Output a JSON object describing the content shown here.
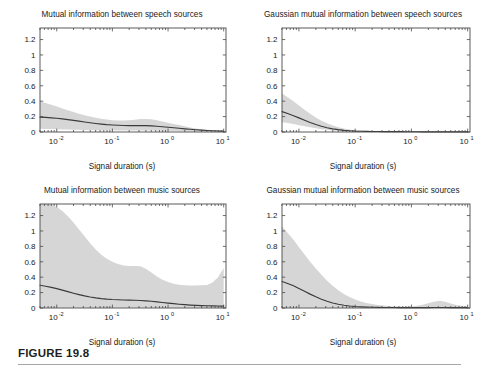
{
  "figure": {
    "caption_label": "FIGURE 19.8",
    "colors": {
      "band": "#d6d6d6",
      "line": "#3a3a3a",
      "axis": "#4a4a4a",
      "text": "#1a1a1a",
      "rule": "#a6a6a6"
    }
  },
  "common": {
    "xlabel": "Signal duration (s)",
    "y_ticks": [
      "0",
      "0.2",
      "0.4",
      "0.6",
      "0.8",
      "1",
      "1.2"
    ],
    "y_tick_values": [
      0,
      0.2,
      0.4,
      0.6,
      0.8,
      1,
      1.2
    ],
    "x_ticks": [
      {
        "mantissa": "10",
        "exponent": "-2",
        "value": 0.01
      },
      {
        "mantissa": "10",
        "exponent": "-1",
        "value": 0.1
      },
      {
        "mantissa": "10",
        "exponent": "0",
        "value": 1
      },
      {
        "mantissa": "10",
        "exponent": "1",
        "value": 10
      }
    ]
  },
  "chart_data": [
    {
      "id": "speech-mi",
      "type": "line",
      "title": "Mutual information between speech sources",
      "xlabel": "Signal duration (s)",
      "ylabel": "",
      "xscale": "log",
      "xlim": [
        0.005,
        11
      ],
      "ylim": [
        0,
        1.35
      ],
      "grid": false,
      "legend": "none",
      "x": [
        0.005,
        0.0063,
        0.008,
        0.01,
        0.0126,
        0.0158,
        0.02,
        0.0251,
        0.0316,
        0.0398,
        0.0501,
        0.0631,
        0.0794,
        0.1,
        0.126,
        0.158,
        0.2,
        0.251,
        0.316,
        0.398,
        0.501,
        0.631,
        0.794,
        1.0,
        1.26,
        1.58,
        2.0,
        2.51,
        3.16,
        3.98,
        5.01,
        6.31,
        7.94,
        10.0
      ],
      "series": [
        {
          "name": "mean",
          "values": [
            0.193,
            0.189,
            0.184,
            0.178,
            0.17,
            0.161,
            0.151,
            0.141,
            0.13,
            0.12,
            0.111,
            0.103,
            0.096,
            0.091,
            0.087,
            0.084,
            0.083,
            0.083,
            0.083,
            0.082,
            0.079,
            0.074,
            0.068,
            0.062,
            0.055,
            0.048,
            0.041,
            0.035,
            0.029,
            0.024,
            0.02,
            0.016,
            0.013,
            0.011
          ]
        },
        {
          "name": "band_upper",
          "values": [
            0.4,
            0.378,
            0.354,
            0.33,
            0.305,
            0.281,
            0.258,
            0.237,
            0.218,
            0.201,
            0.186,
            0.173,
            0.162,
            0.154,
            0.149,
            0.148,
            0.152,
            0.16,
            0.168,
            0.17,
            0.164,
            0.152,
            0.137,
            0.121,
            0.105,
            0.09,
            0.074,
            0.06,
            0.047,
            0.037,
            0.029,
            0.023,
            0.018,
            0.015
          ]
        },
        {
          "name": "band_lower",
          "values": [
            0.041,
            0.04,
            0.038,
            0.036,
            0.034,
            0.032,
            0.03,
            0.028,
            0.026,
            0.025,
            0.024,
            0.023,
            0.022,
            0.022,
            0.021,
            0.021,
            0.021,
            0.021,
            0.021,
            0.02,
            0.019,
            0.018,
            0.016,
            0.015,
            0.013,
            0.011,
            0.01,
            0.008,
            0.007,
            0.006,
            0.005,
            0.005,
            0.004,
            0.004
          ]
        }
      ]
    },
    {
      "id": "speech-gaussian-mi",
      "type": "line",
      "title": "Gaussian mutual information between speech sources",
      "xlabel": "Signal duration (s)",
      "ylabel": "",
      "xscale": "log",
      "xlim": [
        0.005,
        11
      ],
      "ylim": [
        0,
        1.35
      ],
      "grid": false,
      "legend": "none",
      "x": [
        0.005,
        0.0063,
        0.008,
        0.01,
        0.0126,
        0.0158,
        0.02,
        0.0251,
        0.0316,
        0.0398,
        0.0501,
        0.0631,
        0.0794,
        0.1,
        0.126,
        0.158,
        0.2,
        0.251,
        0.316,
        0.398,
        0.501,
        0.631,
        0.794,
        1.0,
        1.26,
        1.58,
        2.0,
        2.51,
        3.16,
        3.98,
        5.01,
        6.31,
        7.94,
        10.0
      ],
      "series": [
        {
          "name": "mean",
          "values": [
            0.265,
            0.24,
            0.212,
            0.183,
            0.153,
            0.124,
            0.098,
            0.075,
            0.056,
            0.041,
            0.03,
            0.022,
            0.016,
            0.012,
            0.01,
            0.008,
            0.007,
            0.006,
            0.005,
            0.005,
            0.004,
            0.004,
            0.003,
            0.003,
            0.003,
            0.002,
            0.002,
            0.002,
            0.002,
            0.002,
            0.002,
            0.001,
            0.001,
            0.001
          ]
        },
        {
          "name": "band_upper",
          "values": [
            0.5,
            0.452,
            0.4,
            0.345,
            0.29,
            0.237,
            0.189,
            0.147,
            0.112,
            0.083,
            0.061,
            0.045,
            0.033,
            0.025,
            0.02,
            0.016,
            0.014,
            0.012,
            0.011,
            0.01,
            0.009,
            0.008,
            0.007,
            0.007,
            0.006,
            0.005,
            0.005,
            0.004,
            0.004,
            0.003,
            0.003,
            0.003,
            0.002,
            0.002
          ]
        },
        {
          "name": "band_lower",
          "values": [
            0.128,
            0.116,
            0.103,
            0.089,
            0.075,
            0.061,
            0.048,
            0.037,
            0.028,
            0.021,
            0.015,
            0.011,
            0.008,
            0.006,
            0.005,
            0.004,
            0.003,
            0.003,
            0.002,
            0.002,
            0.002,
            0.002,
            0.001,
            0.001,
            0.001,
            0.001,
            0.001,
            0.001,
            0.001,
            0.001,
            0.0,
            0.0,
            0.0,
            0.0
          ]
        }
      ]
    },
    {
      "id": "music-mi",
      "type": "line",
      "title": "Mutual information between music sources",
      "xlabel": "Signal duration (s)",
      "ylabel": "",
      "xscale": "log",
      "xlim": [
        0.005,
        11
      ],
      "ylim": [
        0,
        1.35
      ],
      "grid": false,
      "legend": "none",
      "x": [
        0.005,
        0.0063,
        0.008,
        0.01,
        0.0126,
        0.0158,
        0.02,
        0.0251,
        0.0316,
        0.0398,
        0.0501,
        0.0631,
        0.0794,
        0.1,
        0.126,
        0.158,
        0.2,
        0.251,
        0.316,
        0.398,
        0.501,
        0.631,
        0.794,
        1.0,
        1.26,
        1.58,
        2.0,
        2.51,
        3.16,
        3.98,
        5.01,
        6.31,
        7.94,
        10.0
      ],
      "series": [
        {
          "name": "mean",
          "values": [
            0.295,
            0.283,
            0.268,
            0.251,
            0.232,
            0.212,
            0.192,
            0.174,
            0.157,
            0.143,
            0.131,
            0.122,
            0.115,
            0.11,
            0.107,
            0.104,
            0.102,
            0.1,
            0.097,
            0.093,
            0.087,
            0.08,
            0.072,
            0.064,
            0.056,
            0.049,
            0.043,
            0.038,
            0.034,
            0.031,
            0.029,
            0.027,
            0.026,
            0.025
          ]
        },
        {
          "name": "band_upper",
          "values": [
            1.35,
            1.35,
            1.34,
            1.31,
            1.26,
            1.19,
            1.11,
            1.02,
            0.93,
            0.84,
            0.76,
            0.69,
            0.64,
            0.6,
            0.57,
            0.552,
            0.545,
            0.545,
            0.542,
            0.51,
            0.46,
            0.41,
            0.368,
            0.336,
            0.315,
            0.302,
            0.295,
            0.292,
            0.292,
            0.294,
            0.3,
            0.33,
            0.4,
            0.52
          ]
        },
        {
          "name": "band_lower",
          "values": [
            0.004,
            0.004,
            0.004,
            0.004,
            0.004,
            0.004,
            0.004,
            0.004,
            0.004,
            0.004,
            0.004,
            0.004,
            0.004,
            0.004,
            0.004,
            0.004,
            0.004,
            0.004,
            0.004,
            0.004,
            0.004,
            0.004,
            0.004,
            0.004,
            0.004,
            0.004,
            0.004,
            0.004,
            0.004,
            0.004,
            0.004,
            0.004,
            0.004,
            0.004
          ]
        }
      ]
    },
    {
      "id": "music-gaussian-mi",
      "type": "line",
      "title": "Gaussian mutual information between music sources",
      "xlabel": "Signal duration (s)",
      "ylabel": "",
      "xscale": "log",
      "xlim": [
        0.005,
        11
      ],
      "ylim": [
        0,
        1.35
      ],
      "grid": false,
      "legend": "none",
      "x": [
        0.005,
        0.0063,
        0.008,
        0.01,
        0.0126,
        0.0158,
        0.02,
        0.0251,
        0.0316,
        0.0398,
        0.0501,
        0.0631,
        0.0794,
        0.1,
        0.126,
        0.158,
        0.2,
        0.251,
        0.316,
        0.398,
        0.501,
        0.631,
        0.794,
        1.0,
        1.26,
        1.58,
        2.0,
        2.51,
        3.16,
        3.98,
        5.01,
        6.31,
        7.94,
        10.0
      ],
      "series": [
        {
          "name": "mean",
          "values": [
            0.345,
            0.318,
            0.288,
            0.253,
            0.217,
            0.18,
            0.145,
            0.114,
            0.087,
            0.065,
            0.048,
            0.035,
            0.026,
            0.019,
            0.015,
            0.012,
            0.01,
            0.008,
            0.007,
            0.006,
            0.006,
            0.005,
            0.005,
            0.005,
            0.005,
            0.005,
            0.005,
            0.006,
            0.007,
            0.006,
            0.005,
            0.005,
            0.005,
            0.005
          ]
        },
        {
          "name": "band_upper",
          "values": [
            1.06,
            0.975,
            0.885,
            0.79,
            0.695,
            0.6,
            0.512,
            0.43,
            0.355,
            0.29,
            0.232,
            0.183,
            0.142,
            0.11,
            0.085,
            0.066,
            0.051,
            0.04,
            0.032,
            0.026,
            0.022,
            0.02,
            0.019,
            0.021,
            0.028,
            0.042,
            0.062,
            0.082,
            0.095,
            0.082,
            0.058,
            0.038,
            0.028,
            0.022
          ]
        },
        {
          "name": "band_lower",
          "values": [
            0.004,
            0.004,
            0.004,
            0.004,
            0.004,
            0.004,
            0.004,
            0.004,
            0.004,
            0.004,
            0.004,
            0.004,
            0.004,
            0.004,
            0.004,
            0.004,
            0.004,
            0.004,
            0.004,
            0.004,
            0.004,
            0.004,
            0.004,
            0.004,
            0.004,
            0.004,
            0.004,
            0.004,
            0.004,
            0.004,
            0.004,
            0.004,
            0.004,
            0.004
          ]
        }
      ]
    }
  ]
}
